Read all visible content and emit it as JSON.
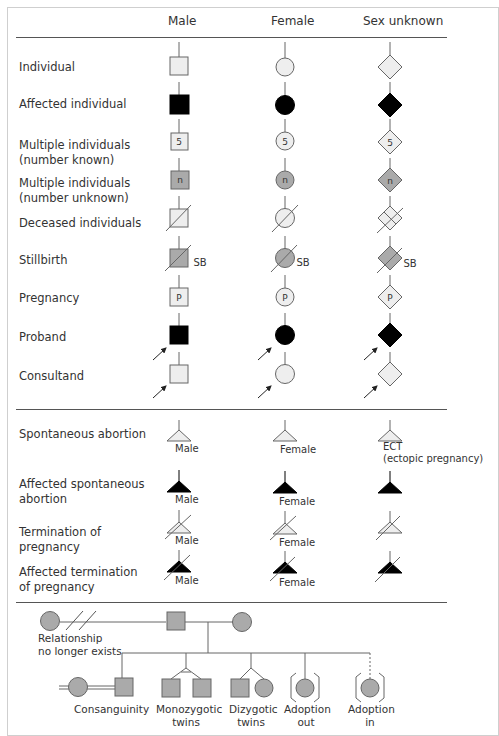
{
  "headers": {
    "male": "Male",
    "female": "Female",
    "unknown": "Sex unknown"
  },
  "rows": [
    {
      "label": "Individual",
      "style": "open",
      "mark": ""
    },
    {
      "label": "Affected individual",
      "style": "affected",
      "mark": ""
    },
    {
      "label": "Multiple individuals\n(number known)",
      "line1": "Multiple individuals",
      "line2": "(number known)",
      "style": "open",
      "mark": "5"
    },
    {
      "label": "Multiple individuals\n(number unknown)",
      "line1": "Multiple individuals",
      "line2": "(number unknown)",
      "style": "gray",
      "mark": "n"
    },
    {
      "label": "Deceased individuals",
      "style": "deceased",
      "mark": ""
    },
    {
      "label": "Stillbirth",
      "style": "stillbirth",
      "mark": "SB"
    },
    {
      "label": "Pregnancy",
      "style": "open",
      "mark": "P"
    },
    {
      "label": "Proband",
      "style": "affected-arrow",
      "mark": ""
    },
    {
      "label": "Consultand",
      "style": "open-arrow",
      "mark": ""
    }
  ],
  "pregnancy_rows": [
    {
      "line1": "Spontaneous abortion",
      "line2": "",
      "male": "Male",
      "female": "Female",
      "unknown": "ECT",
      "unknown_note": "(ectopic pregnancy)"
    },
    {
      "line1": "Affected spontaneous",
      "line2": "abortion",
      "male": "Male",
      "female": "Female",
      "unknown": ""
    },
    {
      "line1": "Termination of",
      "line2": "pregnancy",
      "male": "Male",
      "female": "Female",
      "unknown": ""
    },
    {
      "line1": "Affected termination",
      "line2": "of pregnancy",
      "male": "Male",
      "female": "Female",
      "unknown": ""
    }
  ],
  "relationships": {
    "no_longer_line1": "Relationship",
    "no_longer_line2": "no longer exists",
    "consanguinity": "Consanguinity",
    "mz_line1": "Monozygotic",
    "mz_line2": "twins",
    "dz_line1": "Dizygotic",
    "dz_line2": "twins",
    "adopt_out_line1": "Adoption",
    "adopt_out_line2": "out",
    "adopt_in_line1": "Adoption",
    "adopt_in_line2": "in"
  },
  "colors": {
    "open_fill": "#eeeeee",
    "gray_fill": "#a9a9a9",
    "affected_fill": "#000000",
    "stroke": "#666666"
  }
}
